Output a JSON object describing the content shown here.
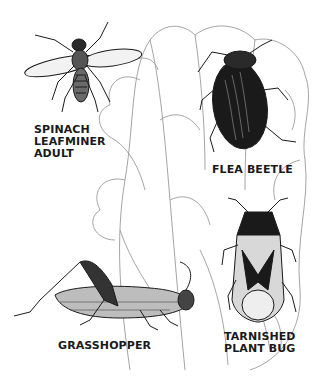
{
  "illustration": {
    "subject": "lettuce/spinach leaf with pest insects",
    "ink_color": "#1a1a1a",
    "leaf_line_color": "#9a9a9a",
    "background": "#ffffff"
  },
  "labels": {
    "leafminer": [
      "SPINACH",
      "LEAFMINER",
      "ADULT"
    ],
    "flea_beetle": [
      "FLEA BEETLE"
    ],
    "grasshopper": [
      "GRASSHOPPER"
    ],
    "plant_bug": [
      "TARNISHED",
      "PLANT BUG"
    ]
  }
}
